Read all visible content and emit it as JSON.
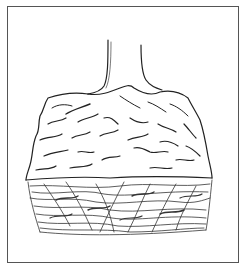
{
  "illustration": {
    "subject": "tree trunk with root ball",
    "style": "black-and-white line drawing",
    "line_color": "#222222",
    "background_color": "#ffffff",
    "frame_color": "#555555",
    "parts": [
      "trunk",
      "soil-clump",
      "root-mass",
      "frame"
    ]
  }
}
